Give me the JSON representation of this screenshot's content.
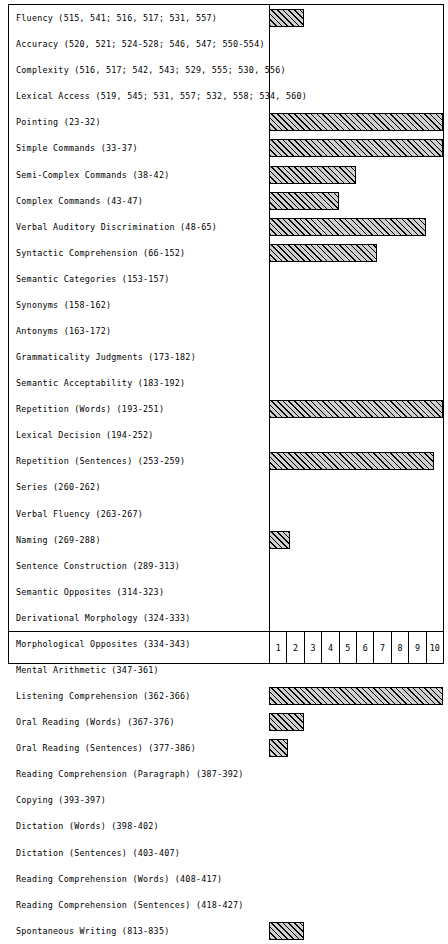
{
  "chart_data": {
    "type": "bar",
    "orientation": "horizontal",
    "title": "",
    "xlabel": "",
    "ylabel": "",
    "xlim": [
      0,
      10
    ],
    "xticks": [
      "1",
      "2",
      "3",
      "4",
      "5",
      "6",
      "7",
      "8",
      "9",
      "10"
    ],
    "grid": true,
    "legend": "none",
    "categories": [
      "Fluency (515, 541; 516, 517; 531, 557)",
      "Accuracy (520, 521; 524-528; 546, 547; 550-554)",
      "Complexity (516, 517; 542, 543; 529, 555; 530, 556)",
      "Lexical Access (519, 545; 531, 557; 532, 558; 534, 560)",
      "Pointing (23-32)",
      "Simple Commands (33-37)",
      "Semi-Complex Commands (38-42)",
      "Complex Commands (43-47)",
      "Verbal Auditory Discrimination (48-65)",
      "Syntactic Comprehension (66-152)",
      "Semantic Categories (153-157)",
      "Synonyms (158-162)",
      "Antonyms (163-172)",
      "Grammaticality Judgments (173-182)",
      "Semantic Acceptability (183-192)",
      "Repetition (Words) (193-251)",
      "Lexical Decision (194-252)",
      "Repetition (Sentences) (253-259)",
      "Series (260-262)",
      "Verbal Fluency (263-267)",
      "Naming (269-288)",
      "Sentence Construction (289-313)",
      "Semantic Opposites (314-323)",
      "Derivational Morphology (324-333)",
      "Morphological Opposites (334-343)",
      "Mental Arithmetic (347-361)",
      "Listening Comprehension  (362-366)",
      "Oral Reading (Words) (367-376)",
      "Oral Reading (Sentences) (377-386)",
      "Reading Comprehension (Paragraph) (387-392)",
      "Copying (393-397)",
      "Dictation (Words) (398-402)",
      "Dictation (Sentences) (403-407)",
      "Reading Comprehension (Words) (408-417)",
      "Reading Comprehension (Sentences) (418-427)",
      "Spontaneous Writing (813-835)"
    ],
    "values": [
      2,
      0,
      0,
      0,
      10,
      10,
      5,
      4,
      9,
      6.2,
      0,
      0,
      0,
      0,
      0,
      10,
      0,
      9.5,
      0,
      0,
      1.2,
      0,
      0,
      0,
      0,
      0,
      10,
      2,
      1.1,
      0,
      0,
      0,
      0,
      0,
      0,
      2
    ]
  }
}
